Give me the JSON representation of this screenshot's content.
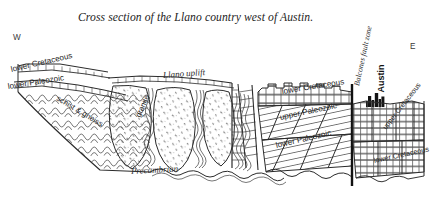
{
  "figure": {
    "title": "Cross section of the Llano country west of Austin.",
    "background_color": "#ffffff",
    "line_color": "#2b2b2b"
  },
  "orientation": {
    "west_marker": "W",
    "east_marker": "E"
  },
  "labels": {
    "lower_cretaceous_west": "lower Cretaceous",
    "lower_paleozoic_west": "lower Paleozoic",
    "schist_and_gneiss": "schist & gneiss",
    "llano_uplift": "Llano uplift",
    "granite": "granite",
    "precambrian": "Precambrian",
    "lower_cretaceous_east": "lower Cretaceous",
    "upper_paleozoic": "upper Paleozoic",
    "lower_paleozoic_east": "lower Paleozoic",
    "balcones_fault_zone": "Balcones fault zone",
    "austin": "Austin",
    "upper_cretaceous_far_east": "upper Cretaceous",
    "lower_cretaceous_far_east": "lower Cretaceous"
  },
  "icons": {
    "city_skyline": "city-skyline-icon"
  }
}
